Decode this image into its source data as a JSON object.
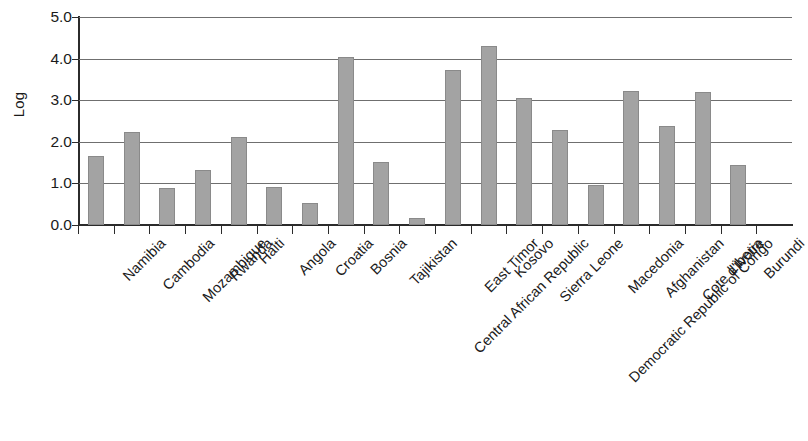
{
  "chart_data": {
    "type": "bar",
    "title": "",
    "xlabel": "",
    "ylabel": "Log",
    "ylim": [
      0.0,
      5.0
    ],
    "yticks": [
      "0.0",
      "1.0",
      "2.0",
      "3.0",
      "4.0",
      "5.0"
    ],
    "ytick_values": [
      0.0,
      1.0,
      2.0,
      3.0,
      4.0,
      5.0
    ],
    "grid": "horizontal",
    "legend": "none",
    "bar_color": "#a3a3a3",
    "bar_edge_color": "#8a8a8a",
    "axis_color": "#2b2b2b",
    "gridline_color": "#6f6f6f",
    "categories": [
      "Namibia",
      "Cambodia",
      "Mozambique",
      "Rwanda",
      "Haiti",
      "Angola",
      "Croatia",
      "Bosnia",
      "Tajikistan",
      "Central African Republic",
      "East Timor",
      "Kosovo",
      "Sierra Leone",
      "Democratic Republic of Congo",
      "Macedonia",
      "Afghanistan",
      "Cote d'Ivoire",
      "Liberia",
      "Burundi"
    ],
    "values": [
      1.65,
      2.24,
      0.88,
      1.32,
      2.11,
      0.92,
      0.54,
      4.03,
      1.52,
      0.17,
      3.73,
      4.3,
      3.06,
      2.28,
      0.95,
      3.21,
      2.38,
      3.2,
      1.45
    ]
  }
}
